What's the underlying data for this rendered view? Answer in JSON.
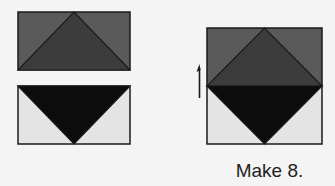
{
  "caption": "Make 8.",
  "colors": {
    "background": "#f4f4f4",
    "medium_gray": "#5a5a5a",
    "dark_gray": "#3c3c3c",
    "black": "#0c0c0c",
    "light_gray": "#e4e4e4",
    "outline": "#1a1a1a"
  },
  "units": [
    {
      "name": "top-unit",
      "description": "Flying geese: dark gray triangle on medium gray background"
    },
    {
      "name": "bottom-unit",
      "description": "Flying geese: black inverted triangle on light gray background"
    },
    {
      "name": "result-block",
      "description": "Square-in-a-square block formed by joining units"
    }
  ]
}
